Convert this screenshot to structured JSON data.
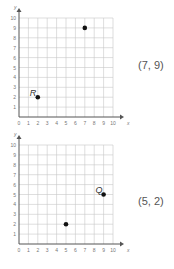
{
  "chart_data": [
    {
      "type": "scatter",
      "title": "",
      "xlabel": "x",
      "ylabel": "y",
      "xlim": [
        0,
        10
      ],
      "ylim": [
        0,
        10
      ],
      "grid": true,
      "x_ticks": [
        "0",
        "1",
        "2",
        "3",
        "4",
        "5",
        "6",
        "7",
        "8",
        "9",
        "10"
      ],
      "y_ticks": [
        "1",
        "2",
        "3",
        "4",
        "5",
        "6",
        "7",
        "8",
        "9",
        "10"
      ],
      "points": [
        {
          "x": 2,
          "y": 2,
          "label": "R"
        },
        {
          "x": 7,
          "y": 9,
          "label": ""
        }
      ],
      "answer": "(7, 9)"
    },
    {
      "type": "scatter",
      "title": "",
      "xlabel": "x",
      "ylabel": "y",
      "xlim": [
        0,
        10
      ],
      "ylim": [
        0,
        10
      ],
      "grid": true,
      "x_ticks": [
        "0",
        "1",
        "2",
        "3",
        "4",
        "5",
        "6",
        "7",
        "8",
        "9",
        "10"
      ],
      "y_ticks": [
        "1",
        "2",
        "3",
        "4",
        "5",
        "6",
        "7",
        "8",
        "9",
        "10"
      ],
      "points": [
        {
          "x": 9,
          "y": 5,
          "label": "Q"
        },
        {
          "x": 5,
          "y": 2,
          "label": ""
        }
      ],
      "answer": "(5, 2)"
    }
  ],
  "colors": {
    "grid": "#c8c8c8",
    "axis": "#555555",
    "point": "#111111"
  }
}
